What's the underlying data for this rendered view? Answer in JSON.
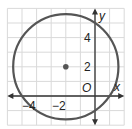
{
  "diagram": {
    "type": "coordinate-plane-circle",
    "grid": {
      "xmin": -6,
      "xmax": 2,
      "ymin": -2,
      "ymax": 6,
      "step": 1
    },
    "circle": {
      "center": [
        -2,
        2
      ],
      "radius_squared": 13,
      "stroke": "#555555"
    },
    "center_point": {
      "x": -2,
      "y": 2,
      "color": "#555555"
    },
    "axis_labels": {
      "x": "x",
      "y": "y",
      "origin": "O"
    },
    "tick_labels": {
      "x": [
        {
          "value": -4,
          "text": "−4"
        },
        {
          "value": -2,
          "text": "−2"
        }
      ],
      "y": [
        {
          "value": 2,
          "text": "2"
        },
        {
          "value": 4,
          "text": "4"
        }
      ]
    },
    "colors": {
      "grid": "#d9d9d9",
      "axis": "#333333",
      "circle": "#555555"
    }
  }
}
